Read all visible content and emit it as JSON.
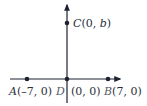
{
  "diagram": {
    "type": "coordinate-plane",
    "colors": {
      "axis": "#1e2230",
      "point": "#1e2230",
      "label": "#2a2f3a"
    },
    "points": [
      {
        "name": "A",
        "coords": "(–7, 0)"
      },
      {
        "name": "B",
        "coords": "(7, 0)"
      },
      {
        "name": "C",
        "coords_prefix": "(0, ",
        "coords_var": "b",
        "coords_suffix": ")"
      },
      {
        "name": "D",
        "coords": "(0, 0)"
      }
    ]
  }
}
